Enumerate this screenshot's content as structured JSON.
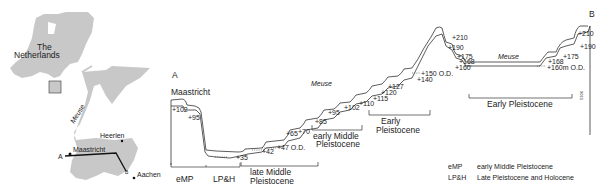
{
  "map": {
    "country_label_line1": "The",
    "country_label_line2": "Netherlands",
    "river_label": "Meuse",
    "cities": [
      "Heerlen",
      "Maastricht",
      "Aachen"
    ],
    "section_points": [
      "A",
      "B"
    ],
    "land_color": "#c8c8c8"
  },
  "profile": {
    "end_a": "A",
    "end_b": "B",
    "start_place": "Maastricht",
    "river_label_1": "Meuse",
    "river_label_2": "Meuse",
    "elevations_left": [
      "+102",
      "+95",
      "+35",
      "+42",
      "+47 O.D.",
      "+65",
      "+70",
      "+85",
      "+95",
      "+102",
      "+110",
      "+115",
      "+120",
      "+127",
      "+140",
      "+150 O.D."
    ],
    "elevations_mid": [
      "+210",
      "+190",
      "+175",
      "+168",
      "+160"
    ],
    "elevations_right": [
      "+210",
      "+190",
      "+175",
      "+168",
      "+160m O.D."
    ],
    "periods": [
      {
        "label_1": "eMP",
        "label_2": ""
      },
      {
        "label_1": "LP&H",
        "label_2": ""
      },
      {
        "label_1": "late Middle",
        "label_2": "Pleistocene"
      },
      {
        "label_1": "early Middle",
        "label_2": "Pleistocene"
      },
      {
        "label_1": "Early",
        "label_2": "Pleistocene"
      },
      {
        "label_1": "Early Pleistocene",
        "label_2": ""
      }
    ],
    "side_code": "5306"
  },
  "legend": [
    {
      "abbr": "eMP",
      "text": "early Middle Pleistocene"
    },
    {
      "abbr": "LP&H",
      "text": "Late Pleistocene and Holocene"
    }
  ]
}
